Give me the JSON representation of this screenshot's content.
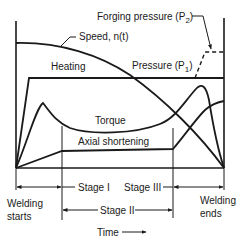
{
  "diagram": {
    "type": "friction-welding-process-curves",
    "colors": {
      "line": "#1a1a1a",
      "background": "#ffffff"
    },
    "curves": {
      "speed": {
        "label": "Speed, n(t)"
      },
      "pressure_p1": {
        "label": "Pressure (P",
        "subscript": "1",
        "suffix": ")"
      },
      "forging_pressure": {
        "label": "Forging pressure (P",
        "subscript": "2",
        "suffix": ")"
      },
      "torque": {
        "label": "Torque"
      },
      "axial_shortening": {
        "label": "Axial shortening"
      }
    },
    "regions": {
      "heating": {
        "label": "Heating"
      }
    },
    "stages": [
      {
        "label": "Stage I"
      },
      {
        "label": "Stage II"
      },
      {
        "label": "Stage III"
      }
    ],
    "events": {
      "start_line1": "Welding",
      "start_line2": "starts",
      "end_line1": "Welding",
      "end_line2": "ends"
    },
    "axis": {
      "x_label": "Time"
    }
  }
}
